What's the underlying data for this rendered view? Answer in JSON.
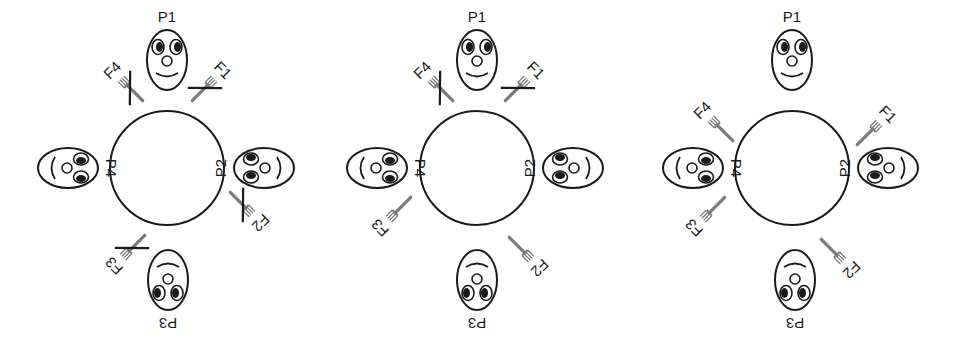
{
  "figure": {
    "colors": {
      "ink": "#1a1a1a",
      "fork": "#7a7a7a",
      "background": "#ffffff"
    }
  },
  "panels": [
    {
      "id": "panel-1",
      "cx": 167,
      "cy": 168,
      "philosophers": [
        {
          "label": "P1",
          "x": 167,
          "y": 60,
          "rot": 0
        },
        {
          "label": "P2",
          "x": 264,
          "y": 168,
          "rot": -90
        },
        {
          "label": "P3",
          "x": 168,
          "y": 280,
          "rot": 180
        },
        {
          "label": "P4",
          "x": 68,
          "y": 168,
          "rot": 90
        }
      ],
      "forks": [
        {
          "label": "F1",
          "x": 205,
          "y": 88,
          "rot": 45,
          "crossed": true
        },
        {
          "label": "F2",
          "x": 243,
          "y": 205,
          "rot": 135,
          "crossed": true
        },
        {
          "label": "F3",
          "x": 132,
          "y": 248,
          "rot": 225,
          "crossed": true
        },
        {
          "label": "F4",
          "x": 130,
          "y": 88,
          "rot": -45,
          "crossed": true
        }
      ]
    },
    {
      "id": "panel-2",
      "cx": 477,
      "cy": 168,
      "philosophers": [
        {
          "label": "P1",
          "x": 477,
          "y": 60,
          "rot": 0
        },
        {
          "label": "P2",
          "x": 573,
          "y": 168,
          "rot": -90
        },
        {
          "label": "P3",
          "x": 477,
          "y": 280,
          "rot": 180
        },
        {
          "label": "P4",
          "x": 377,
          "y": 168,
          "rot": 90
        }
      ],
      "forks": [
        {
          "label": "F1",
          "x": 518,
          "y": 88,
          "rot": 45,
          "crossed": true
        },
        {
          "label": "F2",
          "x": 522,
          "y": 250,
          "rot": 135,
          "crossed": false
        },
        {
          "label": "F3",
          "x": 398,
          "y": 210,
          "rot": 225,
          "crossed": false
        },
        {
          "label": "F4",
          "x": 440,
          "y": 88,
          "rot": -45,
          "crossed": true
        }
      ]
    },
    {
      "id": "panel-3",
      "cx": 792,
      "cy": 168,
      "philosophers": [
        {
          "label": "P1",
          "x": 792,
          "y": 60,
          "rot": 0
        },
        {
          "label": "P2",
          "x": 888,
          "y": 168,
          "rot": -90
        },
        {
          "label": "P3",
          "x": 795,
          "y": 280,
          "rot": 180
        },
        {
          "label": "P4",
          "x": 693,
          "y": 168,
          "rot": 90
        }
      ],
      "forks": [
        {
          "label": "F1",
          "x": 870,
          "y": 132,
          "rot": 45,
          "crossed": false
        },
        {
          "label": "F2",
          "x": 834,
          "y": 252,
          "rot": 135,
          "crossed": false
        },
        {
          "label": "F3",
          "x": 712,
          "y": 210,
          "rot": 225,
          "crossed": false
        },
        {
          "label": "F4",
          "x": 720,
          "y": 128,
          "rot": -45,
          "crossed": false
        }
      ]
    }
  ]
}
